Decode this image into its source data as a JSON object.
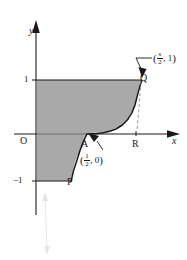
{
  "figure": {
    "type": "cartesian-graph",
    "background": "#ffffff",
    "shade_color": "#a9a9a9",
    "line_color": "#1a1a1a",
    "axes": {
      "x_label": "x",
      "y_label": "y",
      "origin_label": "O",
      "x_axis_y_px": 134,
      "y_axis_x_px": 36
    },
    "ticks": {
      "y_positive": "1",
      "y_negative": "−1"
    },
    "points": [
      {
        "name": "P",
        "label": "P",
        "x_px": 70,
        "y_px": 182
      },
      {
        "name": "A",
        "label": "A",
        "x_px": 85,
        "y_px": 145
      },
      {
        "name": "Q",
        "label": "Q",
        "x_px": 143,
        "y_px": 79
      },
      {
        "name": "R",
        "label": "R",
        "x_px": 136,
        "y_px": 145
      }
    ],
    "annotations": [
      {
        "name": "q-coordinate",
        "open_paren": "(",
        "fraction_num": "s",
        "fraction_den": "2",
        "separator": ", ",
        "second": "1",
        "close_paren": ")",
        "text": "(s/2, 1)"
      },
      {
        "name": "a-coordinate",
        "open_paren": "(",
        "fraction_num": "1",
        "fraction_den": "2",
        "separator": ", ",
        "second": "0",
        "close_paren": ")",
        "text": "(1/2, 0)"
      }
    ],
    "curve": {
      "description": "shaded region bounded above by y=1 from x=0 to Q, right by curve from Q down to A, and below by y=-1 segment from x=0 to P",
      "shade_top_y_px": 80,
      "shade_bottom_y_px": 181
    }
  }
}
